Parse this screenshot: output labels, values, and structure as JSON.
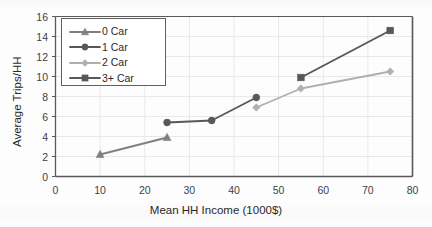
{
  "chart_data": {
    "type": "line",
    "title": "",
    "xlabel": "Mean HH Income (1000$)",
    "ylabel": "Average Trips/HH",
    "xlim": [
      0,
      80
    ],
    "ylim": [
      0,
      16
    ],
    "xticks": [
      0,
      10,
      20,
      30,
      40,
      50,
      60,
      70,
      80
    ],
    "yticks": [
      0,
      2,
      4,
      6,
      8,
      10,
      12,
      14,
      16
    ],
    "grid": true,
    "legend_position": "top-left",
    "series": [
      {
        "name": "0 Car",
        "marker": "triangle",
        "color": "#808080",
        "points": [
          {
            "x": 10,
            "y": 2.2
          },
          {
            "x": 25,
            "y": 3.9
          }
        ]
      },
      {
        "name": "1 Car",
        "marker": "circle",
        "color": "#585858",
        "points": [
          {
            "x": 25,
            "y": 5.4
          },
          {
            "x": 35,
            "y": 5.6
          },
          {
            "x": 45,
            "y": 7.9
          }
        ]
      },
      {
        "name": "2 Car",
        "marker": "diamond",
        "color": "#b0b0b0",
        "points": [
          {
            "x": 45,
            "y": 6.9
          },
          {
            "x": 55,
            "y": 8.8
          },
          {
            "x": 75,
            "y": 10.5
          }
        ]
      },
      {
        "name": "3+ Car",
        "marker": "square",
        "color": "#585858",
        "points": [
          {
            "x": 55,
            "y": 9.9
          },
          {
            "x": 75,
            "y": 14.6
          }
        ]
      }
    ]
  },
  "axis": {
    "x_title": "Mean HH Income (1000$)",
    "y_title": "Average Trips/HH",
    "x_tick_labels": [
      "0",
      "10",
      "20",
      "30",
      "40",
      "50",
      "60",
      "70",
      "80"
    ],
    "y_tick_labels": [
      "0",
      "2",
      "4",
      "6",
      "8",
      "10",
      "12",
      "14",
      "16"
    ]
  },
  "legend": {
    "items": [
      {
        "label": "0 Car"
      },
      {
        "label": "1 Car"
      },
      {
        "label": "2 Car"
      },
      {
        "label": "3+ Car"
      }
    ]
  },
  "colors": {
    "plot_border": "#595959",
    "gridline": "#e8e8e8",
    "tick_text": "#3f3f3f",
    "axis_title_text": "#2a2a2a",
    "series_0_car": "#808080",
    "series_1_car": "#585858",
    "series_2_car": "#b0b0b0",
    "series_3plus_car": "#585858"
  }
}
